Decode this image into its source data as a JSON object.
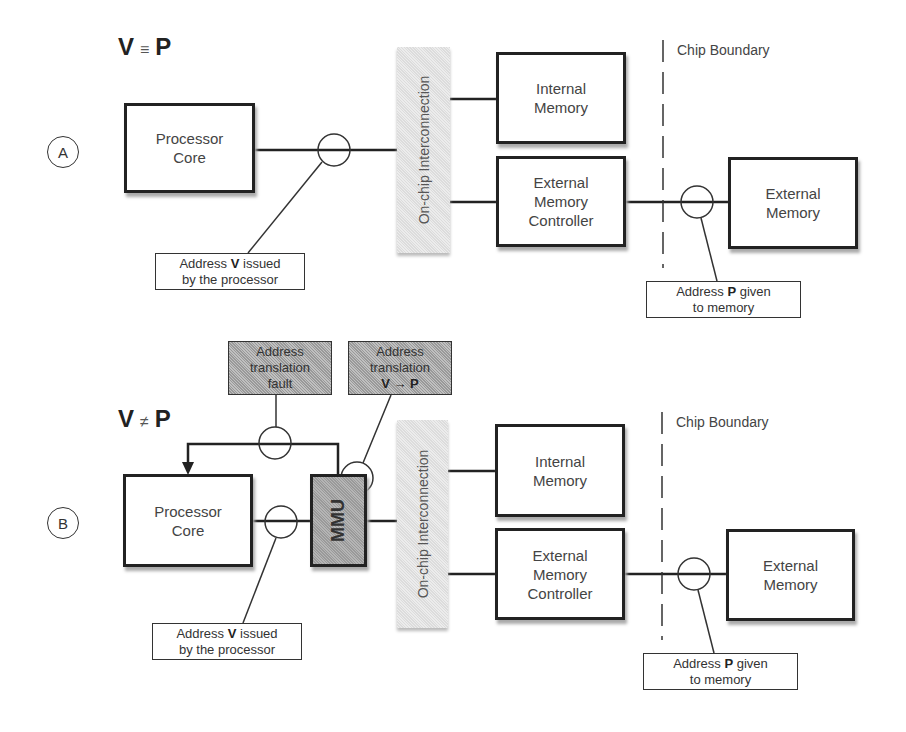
{
  "panel_a": {
    "label": "A",
    "title_left": "V",
    "title_op": "≡",
    "title_right": "P",
    "processor_core": "Processor Core",
    "interconnect": "On-chip Interconnection",
    "internal_memory": "Internal Memory",
    "ext_mem_controller": "External Memory Controller",
    "external_memory": "External Memory",
    "chip_boundary": "Chip Boundary",
    "callout_v": {
      "pre": "Address ",
      "bold": "V",
      "post": " issued",
      "line2": "by the processor"
    },
    "callout_p": {
      "pre": "Address ",
      "bold": "P",
      "post": " given",
      "line2": "to memory"
    }
  },
  "panel_b": {
    "label": "B",
    "title_left": "V",
    "title_op": "≠",
    "title_right": "P",
    "processor_core": "Processor Core",
    "mmu": "MMU",
    "interconnect": "On-chip Interconnection",
    "internal_memory": "Internal Memory",
    "ext_mem_controller": "External Memory Controller",
    "external_memory": "External Memory",
    "chip_boundary": "Chip Boundary",
    "fault_box": {
      "line1": "Address",
      "line2": "translation",
      "line3": "fault"
    },
    "translation_box": {
      "line1": "Address",
      "line2": "translation",
      "line3": "V → P"
    },
    "callout_v": {
      "pre": "Address ",
      "bold": "V",
      "post": " issued",
      "line2": "by the processor"
    },
    "callout_p": {
      "pre": "Address ",
      "bold": "P",
      "post": " given",
      "line2": "to memory"
    }
  }
}
